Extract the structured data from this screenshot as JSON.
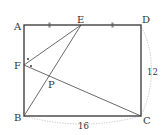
{
  "diagram": {
    "type": "geometry",
    "shape": "rectangle ABCD",
    "points": {
      "A": {
        "label": "A",
        "x": 24,
        "y": 25
      },
      "B": {
        "label": "B",
        "x": 24,
        "y": 116
      },
      "C": {
        "label": "C",
        "x": 141,
        "y": 116
      },
      "D": {
        "label": "D",
        "x": 141,
        "y": 25
      },
      "E": {
        "label": "E",
        "x": 81,
        "y": 25
      },
      "F": {
        "label": "F",
        "x": 24,
        "y": 65
      },
      "P": {
        "label": "P",
        "x": 49,
        "y": 76
      }
    },
    "measurements": {
      "CD": "12",
      "BC": "16"
    },
    "marks": {
      "AE_equals_ED": "tick marks indicate AE = ED",
      "angle_F": "dots indicate angle AFE = angle EFC"
    },
    "colors": {
      "line": "#333333",
      "dotted": "#bbbbbb"
    }
  }
}
